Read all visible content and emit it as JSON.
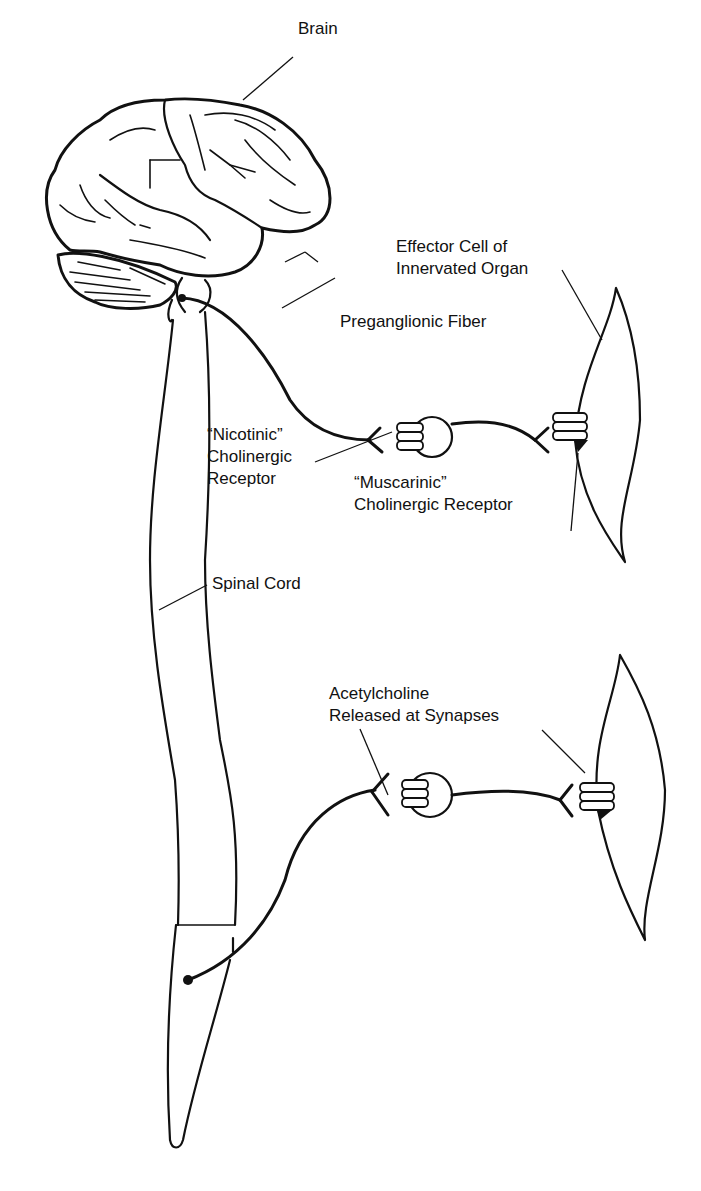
{
  "diagram": {
    "type": "anatomical-illustration",
    "labels": {
      "brain": "Brain",
      "effector_line1": "Effector Cell of",
      "effector_line2": "Innervated Organ",
      "preganglionic": "Preganglionic Fiber",
      "nicotinic_line1": "“Nicotinic”",
      "nicotinic_line2": "Cholinergic",
      "nicotinic_line3": "Receptor",
      "muscarinic_line1": "“Muscarinic”",
      "muscarinic_line2": "Cholinergic Receptor",
      "spinal_cord": "Spinal Cord",
      "ach_line1": "Acetylcholine",
      "ach_line2": "Released at Synapses"
    },
    "components": [
      "brain",
      "brainstem",
      "spinal-cord",
      "cranial-preganglionic-fiber",
      "sacral-preganglionic-fiber",
      "ganglion-cell-upper",
      "ganglion-cell-lower",
      "effector-cell-upper",
      "effector-cell-lower"
    ]
  }
}
